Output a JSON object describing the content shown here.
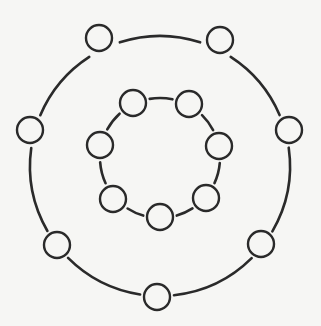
{
  "diagram": {
    "type": "concentric-node-rings",
    "background": "#f6f6f4",
    "stroke": "#2a2a2a",
    "node_radius": 13,
    "outer_ring": {
      "center": [
        160,
        166
      ],
      "radius": 130,
      "node_count": 8,
      "nodes": [
        [
          99,
          38
        ],
        [
          220,
          40
        ],
        [
          289,
          130
        ],
        [
          261,
          244
        ],
        [
          157,
          297
        ],
        [
          57,
          245
        ],
        [
          30,
          130
        ]
      ]
    },
    "inner_ring": {
      "center": [
        160,
        158
      ],
      "radius": 60,
      "node_count": 8,
      "nodes": [
        [
          133,
          103
        ],
        [
          189,
          104
        ],
        [
          219,
          146
        ],
        [
          206,
          198
        ],
        [
          160,
          217
        ],
        [
          113,
          199
        ],
        [
          100,
          145
        ]
      ]
    }
  }
}
